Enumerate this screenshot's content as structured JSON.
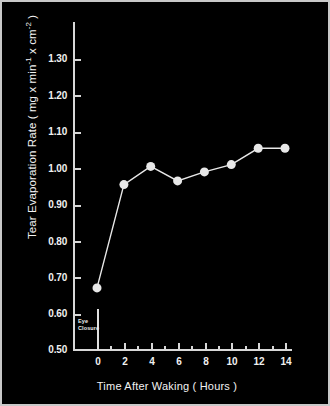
{
  "chart_data": {
    "type": "line",
    "title": "",
    "xlabel": "Time After Waking  ( Hours )",
    "ylabel": "Tear Evaporation Rate ( mg x min",
    "ylabel_sup1": "-1",
    "ylabel_mid": " x cm",
    "ylabel_sup2": "-2",
    "ylabel_end": " )",
    "x": [
      0,
      2,
      4,
      6,
      8,
      10,
      12,
      14
    ],
    "values": [
      0.67,
      0.955,
      1.005,
      0.965,
      0.99,
      1.01,
      1.055,
      1.055
    ],
    "xlim": [
      -1,
      15
    ],
    "ylim": [
      0.5,
      1.3
    ],
    "xticks": [
      0,
      2,
      4,
      6,
      8,
      10,
      12,
      14
    ],
    "xtick_labels": [
      "0",
      "2",
      "4",
      "6",
      "8",
      "10",
      "12",
      "14"
    ],
    "xticks_minor": [
      1,
      3,
      5,
      7,
      9,
      11,
      13,
      15
    ],
    "yticks": [
      0.5,
      0.6,
      0.7,
      0.8,
      0.9,
      1.0,
      1.1,
      1.2,
      1.3
    ],
    "ytick_labels": [
      "0.50",
      "0.60",
      "0.70",
      "0.80",
      "0.90",
      "1.00",
      "1.10",
      "1.20",
      "1.30"
    ],
    "grid": false,
    "legend": null,
    "annotations": [
      {
        "text_line1": "Eye",
        "text_line2": "Closure",
        "x": 0,
        "y_from": 0.5,
        "y_to": 0.61
      }
    ],
    "colors": {
      "background": "#000000",
      "axis": "#d8d8d8",
      "line": "#e8e8e8",
      "marker_fill": "#e8e8e8",
      "text": "#f2f2f2",
      "frame": "#c9c9c9"
    },
    "marker": "circle",
    "marker_size": 9
  }
}
